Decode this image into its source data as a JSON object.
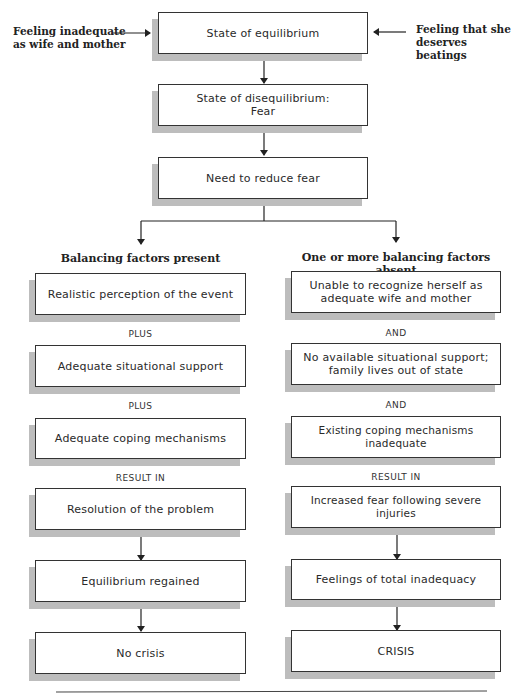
{
  "diagram": {
    "side_inputs": {
      "left": "Feeling inadequate as wife and mother",
      "left_lines": [
        "Feeling inadequate",
        "as wife and mother"
      ],
      "right": "Feeling that she deserves beatings",
      "right_lines": [
        "Feeling that she",
        "deserves beatings"
      ]
    },
    "top_flow": [
      {
        "text": "State of equilibrium"
      },
      {
        "text_lines": [
          "State of disequilibrium:",
          "Fear"
        ]
      },
      {
        "text": "Need to reduce fear"
      }
    ],
    "left_branch": {
      "heading": "Balancing factors present",
      "factors": [
        "Realistic perception of the event",
        "Adequate situational support",
        "Adequate coping mechanisms"
      ],
      "connectors": [
        "PLUS",
        "PLUS",
        "RESULT IN"
      ],
      "outcomes": [
        "Resolution of the problem",
        "Equilibrium regained",
        "No crisis"
      ]
    },
    "right_branch": {
      "heading": "One or more balancing factors absent",
      "factors": [
        [
          "Unable to recognize herself as",
          "adequate wife and mother"
        ],
        [
          "No available situational support;",
          "family lives out of state"
        ],
        "Existing coping mechanisms inadequate"
      ],
      "connectors": [
        "AND",
        "AND",
        "RESULT IN"
      ],
      "outcomes": [
        "Increased fear following severe injuries",
        "Feelings of total inadequacy",
        "CRISIS"
      ]
    }
  }
}
